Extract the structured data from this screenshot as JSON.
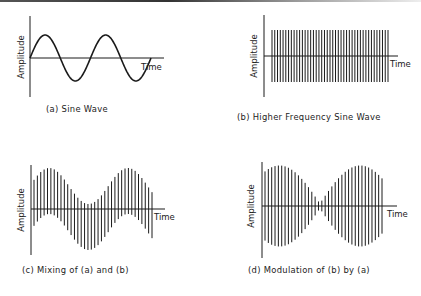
{
  "figure": {
    "panels": [
      {
        "id": "a",
        "caption": "(a) Sine Wave",
        "y_axis_label": "Amplitude",
        "x_axis_label": "Time"
      },
      {
        "id": "b",
        "caption": "(b) Higher Frequency Sine Wave",
        "y_axis_label": "Amplitude",
        "x_axis_label": "Time"
      },
      {
        "id": "c",
        "caption": "(c) Mixing of (a) and (b)",
        "y_axis_label": "Amplitude",
        "x_axis_label": "Time"
      },
      {
        "id": "d",
        "caption": "(d) Modulation of (b) by (a)",
        "y_axis_label": "Amplitude",
        "x_axis_label": "Time"
      }
    ],
    "colors": {
      "ink": "#1a1a1a",
      "background": "#ffffff"
    }
  },
  "chart_data": [
    {
      "type": "line",
      "title": "(a) Sine Wave",
      "xlabel": "Time",
      "ylabel": "Amplitude",
      "signal": "sine",
      "cycles": 2,
      "amplitude": 1
    },
    {
      "type": "line",
      "title": "(b) Higher Frequency Sine Wave",
      "xlabel": "Time",
      "ylabel": "Amplitude",
      "signal": "high-frequency sine",
      "visible_oscillations": 43,
      "amplitude": 1
    },
    {
      "type": "line",
      "title": "(c) Mixing of (a) and (b)",
      "xlabel": "Time",
      "ylabel": "Amplitude",
      "signal": "sum of (a) and (b)",
      "carrier_oscillations": 36,
      "baseband_cycles": 1.5
    },
    {
      "type": "line",
      "title": "(d) Modulation of (b) by (a)",
      "xlabel": "Time",
      "ylabel": "Amplitude",
      "signal": "(b) amplitude-modulated by (a)",
      "carrier_oscillations": 36,
      "envelope_lobes": 2
    }
  ]
}
